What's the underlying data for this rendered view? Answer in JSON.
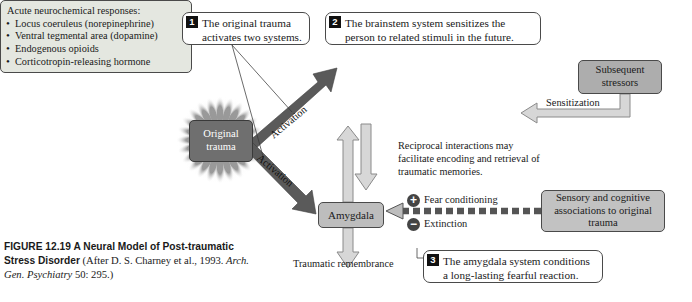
{
  "figure": {
    "label": "FIGURE 12.19",
    "title": "A Neural Model of Post-traumatic Stress Disorder",
    "source_prefix": "(After D. S. Charney et al., 1993.",
    "source_italic": "Arch. Gen. Psychiatry",
    "source_suffix": "50: 295.)"
  },
  "callouts": [
    {
      "num": "1",
      "text": "The original trauma activates two systems."
    },
    {
      "num": "2",
      "text": "The brainstem system sensitizes the person to related stimuli in the future."
    },
    {
      "num": "3",
      "text": "The amygdala system conditions a long-lasting fearful reaction."
    }
  ],
  "nodes": {
    "original_trauma": "Original trauma",
    "amygdala": "Amygdala",
    "subsequent_stressors": "Subsequent stressors",
    "sensory_cognitive": "Sensory and cognitive associations to original trauma"
  },
  "neurochemical_box": {
    "heading": "Acute neurochemical responses:",
    "items": [
      "Locus coeruleus (norepinephrine)",
      "Ventral tegmental area (dopamine)",
      "Endogenous opioids",
      "Corticotropin-releasing hormone"
    ]
  },
  "edge_labels": {
    "activation_upper": "Activation",
    "activation_lower": "Activation",
    "sensitization": "Sensitization",
    "reciprocal": "Reciprocal interactions may facilitate encoding and retrieval of traumatic memories.",
    "traumatic_remembrance": "Traumatic remembrance"
  },
  "valence": {
    "plus_symbol": "+",
    "plus_label": "Fear conditioning",
    "minus_symbol": "−",
    "minus_label": "Extinction"
  },
  "colors": {
    "trauma_fill": "#6f6f6f",
    "amygdala_fill": "#bdbdbd",
    "stressors_fill": "#adadad",
    "sensory_fill": "#c2c2c2",
    "neuro_fill": "#e4e7e0",
    "arrow_dark": "#5a5a5a",
    "arrow_outline_fill": "#d7d7d7",
    "stroke": "#4a4a4a"
  }
}
